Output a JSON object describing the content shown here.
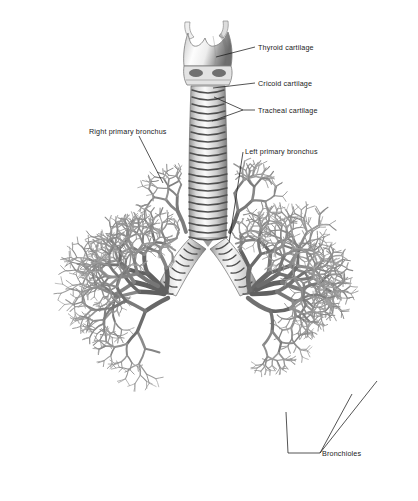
{
  "figure": {
    "background_color": "#ffffff",
    "ink_color": "#1b1b1b",
    "style": "grayscale anatomical illustration"
  },
  "labels": {
    "thyroid_cartilage": "Thyroid cartilage",
    "cricoid_cartilage": "Cricoid cartilage",
    "tracheal_cartilage": "Tracheal cartilage",
    "right_primary_bronchus": "Right primary bronchus",
    "left_primary_bronchus": "Left primary bronchus",
    "bronchioles": "Bronchioles"
  },
  "structures": {
    "larynx": {
      "name": "larynx",
      "parts": [
        "superior horns",
        "thyroid cartilage",
        "cricoid cartilage"
      ]
    },
    "trachea": {
      "name": "trachea",
      "ring_count": 22
    },
    "carina": {
      "name": "carina"
    },
    "left_lung_tree": {
      "name": "left bronchial tree"
    },
    "right_lung_tree": {
      "name": "right bronchial tree"
    },
    "cardiac_notch": {
      "name": "cardiac notch void"
    }
  }
}
